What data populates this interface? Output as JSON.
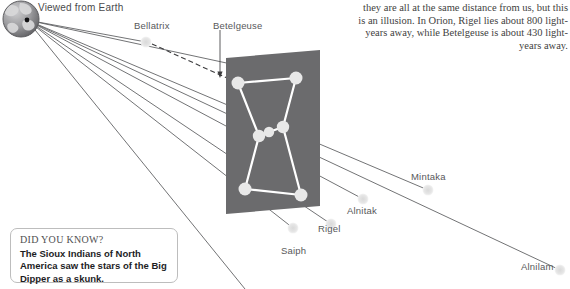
{
  "figure": {
    "title_caption": "Viewed from Earth",
    "intro_text": "they are all at the same distance from us, but this is an illusion. In Orion, Rigel lies about 800 light-years away, while Betelgeuse is about 430 light-years away.",
    "panel_color": "#6b6b6d",
    "star_color": "#e8e8e8",
    "line_color": "#ffffff",
    "ray_color": "#595a5c",
    "label_color": "#58585a",
    "ghost_star_color": "#e2e2e2"
  },
  "globe": {
    "icon": "earth-globe-icon",
    "ocean_color": "#9a9a9c",
    "land_color": "#dcdcdc"
  },
  "stars": [
    {
      "name": "Bellatrix",
      "label": "Bellatrix",
      "panel_x": 238,
      "panel_y": 83,
      "ghost_x": 146,
      "ghost_y": 42,
      "label_x": 134,
      "label_y": 20
    },
    {
      "name": "Betelgeuse",
      "label": "Betelgeuse",
      "panel_x": 296,
      "panel_y": 78,
      "ghost_x": 220,
      "ghost_y": 75,
      "label_x": 213,
      "label_y": 20
    },
    {
      "name": "Mintaka",
      "label": "Mintaka",
      "panel_x": 259,
      "panel_y": 136,
      "ghost_x": 428,
      "ghost_y": 190,
      "label_x": 411,
      "label_y": 171
    },
    {
      "name": "Alnilam",
      "label": "Alnilam",
      "panel_x": 269,
      "panel_y": 132,
      "ghost_x": 560,
      "ghost_y": 270,
      "label_x": 521,
      "label_y": 261
    },
    {
      "name": "Alnitak",
      "label": "Alnitak",
      "panel_x": 283,
      "panel_y": 127,
      "ghost_x": 363,
      "ghost_y": 199,
      "label_x": 347,
      "label_y": 205
    },
    {
      "name": "Rigel",
      "label": "Rigel",
      "panel_x": 301,
      "panel_y": 195,
      "ghost_x": 331,
      "ghost_y": 224,
      "label_x": 318,
      "label_y": 223
    },
    {
      "name": "Saiph",
      "label": "Saiph",
      "panel_x": 245,
      "panel_y": 189,
      "ghost_x": 293,
      "ghost_y": 228,
      "label_x": 281,
      "label_y": 245
    }
  ],
  "constellation_lines": [
    {
      "from": "Bellatrix",
      "to": "Betelgeuse"
    },
    {
      "from": "Bellatrix",
      "to": "Mintaka"
    },
    {
      "from": "Betelgeuse",
      "to": "Alnitak"
    },
    {
      "from": "Mintaka",
      "to": "Saiph"
    },
    {
      "from": "Alnitak",
      "to": "Rigel"
    },
    {
      "from": "Saiph",
      "to": "Rigel"
    },
    {
      "from": "Mintaka",
      "to": "Alnilam"
    },
    {
      "from": "Alnilam",
      "to": "Alnitak"
    }
  ],
  "did_you_know": {
    "title": "DID YOU KNOW?",
    "body": "The Sioux Indians of North America saw the stars of the Big Dipper as a skunk."
  }
}
